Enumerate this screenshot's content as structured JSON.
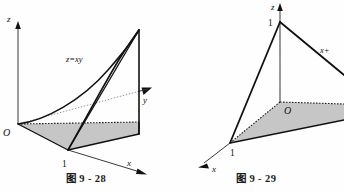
{
  "page": {
    "background_color": "#fefefe",
    "ink_color": "#111111",
    "shade_color": "#c6c6c6",
    "width": 344,
    "height": 193
  },
  "figures": [
    {
      "id": "figure-9-28",
      "caption": "图 9 - 28",
      "axes": {
        "z_label": "z",
        "y_label": "y",
        "x_label": "x",
        "origin_label": "O"
      },
      "ticks": [
        {
          "axis": "x",
          "label": "1"
        }
      ],
      "annotations": [
        {
          "name": "surface-equation",
          "text": "z=xy"
        }
      ]
    },
    {
      "id": "figure-9-29",
      "caption": "图 9 - 29",
      "axes": {
        "z_label": "z",
        "x_label": "x",
        "origin_label": "O"
      },
      "ticks": [
        {
          "axis": "z",
          "label": "1"
        },
        {
          "axis": "x",
          "label": "1"
        }
      ],
      "annotations": [
        {
          "name": "plane-equation",
          "text": "x+"
        }
      ]
    }
  ]
}
